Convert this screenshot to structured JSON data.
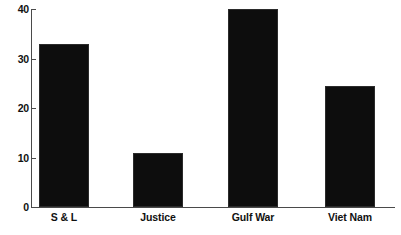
{
  "chart_data": {
    "type": "bar",
    "title": "",
    "subtitle": "",
    "xlabel": "",
    "ylabel": "",
    "categories": [
      "S & L",
      "Justice",
      "Gulf War",
      "Viet Nam"
    ],
    "values": [
      33,
      11,
      40,
      24.5
    ],
    "series": [
      {
        "name": "",
        "values": [
          33,
          11,
          40,
          24.5
        ]
      }
    ],
    "ylim": [
      0,
      40
    ],
    "yticks": [
      0,
      10,
      20,
      30,
      40
    ],
    "ytick_labels": [
      "0",
      "10",
      "20",
      "30",
      "40"
    ],
    "grid": false,
    "legend": false,
    "legend_position": "none",
    "bar_color": "#0d0d0d",
    "axis_color": "#4a4a4a",
    "background_color": "#ffffff",
    "annotations": []
  },
  "axis": {
    "y_ticks": [
      {
        "label": "40",
        "value": 40
      },
      {
        "label": "30",
        "value": 30
      },
      {
        "label": "20",
        "value": 20
      },
      {
        "label": "10",
        "value": 10
      },
      {
        "label": "0",
        "value": 0
      }
    ]
  },
  "bars": [
    {
      "label": "S & L",
      "value": 33
    },
    {
      "label": "Justice",
      "value": 11
    },
    {
      "label": "Gulf War",
      "value": 40
    },
    {
      "label": "Viet Nam",
      "value": 24.5
    }
  ]
}
